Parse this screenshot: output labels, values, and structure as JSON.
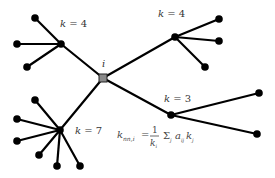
{
  "diagram": {
    "center": {
      "id": "i",
      "label": "i",
      "x": 103,
      "y": 78,
      "color": "#8a8a8a",
      "label_pos": [
        102,
        67
      ]
    },
    "hubs": [
      {
        "id": "hub-top-left",
        "label": "k = 4",
        "x": 61,
        "y": 44,
        "label_pos": [
          60,
          27
        ],
        "leaves": [
          [
            35,
            18
          ],
          [
            17,
            44
          ],
          [
            27,
            67
          ]
        ]
      },
      {
        "id": "hub-top-right",
        "label": "k = 4",
        "x": 175,
        "y": 37,
        "label_pos": [
          158,
          17
        ],
        "leaves": [
          [
            219,
            19
          ],
          [
            219,
            41
          ],
          [
            205,
            67
          ]
        ]
      },
      {
        "id": "hub-bottom-left",
        "label": "k = 7",
        "x": 60,
        "y": 130,
        "label_pos": [
          75,
          134
        ],
        "leaves": [
          [
            35,
            100
          ],
          [
            17,
            119
          ],
          [
            17,
            141
          ],
          [
            39,
            155
          ],
          [
            57,
            166
          ],
          [
            80,
            166
          ]
        ]
      },
      {
        "id": "hub-right",
        "label": "k = 3",
        "x": 171,
        "y": 115,
        "label_pos": [
          164,
          102
        ],
        "leaves": [
          [
            259,
            93
          ],
          [
            257,
            134
          ]
        ]
      }
    ],
    "formula": {
      "lhs": "k",
      "lhs_sub": "nn,i",
      "equals": "=",
      "numerator": "1",
      "denominator": "k",
      "denominator_sub": "i",
      "sigma": "Σ",
      "sigma_sub": "j",
      "term1": "a",
      "term1_sub": "ij",
      "term2": "k",
      "term2_sub": "j"
    },
    "colors": {
      "edge": "#000000",
      "node": "#000000",
      "center": "#8a8a8a",
      "text": "#333333"
    }
  }
}
